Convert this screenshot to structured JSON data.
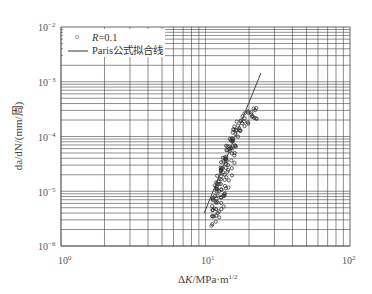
{
  "chart_data": {
    "type": "scatter",
    "title": "",
    "xlabel": "ΔK/MPa·m^1/2",
    "ylabel": "da/dN/(mm/周)",
    "xscale": "log",
    "yscale": "log",
    "xlim": [
      1,
      100
    ],
    "ylim": [
      1e-06,
      0.01
    ],
    "grid": true,
    "legend_position": "upper left",
    "x_ticks": [
      "10^0",
      "10^1",
      "10^2"
    ],
    "y_ticks": [
      "10^-6",
      "10^-5",
      "10^-4",
      "10^-3",
      "10^-2"
    ],
    "legend": [
      {
        "marker": "circle",
        "label_italic": "R",
        "label": "=0.1"
      },
      {
        "marker": "line",
        "label": "Paris公式拟合线"
      }
    ],
    "series": [
      {
        "name": "R=0.1",
        "type": "scatter",
        "points": [
          [
            11.1,
            2.8e-06
          ],
          [
            11.3,
            4.5e-06
          ],
          [
            11.5,
            6e-06
          ],
          [
            11.6,
            8e-06
          ],
          [
            11.8,
            1.1e-05
          ],
          [
            12.0,
            9e-06
          ],
          [
            12.2,
            1.4e-05
          ],
          [
            12.4,
            1.8e-05
          ],
          [
            12.6,
            1.2e-05
          ],
          [
            12.8,
            2.2e-05
          ],
          [
            13.0,
            2.8e-05
          ],
          [
            13.2,
            2e-05
          ],
          [
            13.5,
            3.5e-05
          ],
          [
            13.8,
            4.5e-05
          ],
          [
            14.0,
            3e-05
          ],
          [
            14.3,
            5.5e-05
          ],
          [
            14.6,
            6.8e-05
          ],
          [
            15.0,
            8e-05
          ],
          [
            15.4,
            9.5e-05
          ],
          [
            15.8,
            0.00011
          ],
          [
            16.3,
            0.00013
          ],
          [
            16.8,
            0.00015
          ],
          [
            17.5,
            0.00017
          ],
          [
            18.3,
            0.00019
          ],
          [
            19.2,
            0.00022
          ],
          [
            20.2,
            0.00024
          ],
          [
            21.3,
            0.00026
          ],
          [
            22.3,
            0.00028
          ],
          [
            12.1,
            3.5e-06
          ],
          [
            12.5,
            5e-06
          ],
          [
            13.1,
            7e-06
          ],
          [
            13.6,
            1e-05
          ],
          [
            14.2,
            1.5e-05
          ],
          [
            14.8,
            2.5e-05
          ],
          [
            15.5,
            4e-05
          ],
          [
            16.0,
            6e-05
          ]
        ]
      },
      {
        "name": "Paris公式拟合线",
        "type": "line",
        "points": [
          [
            9.8,
            4e-06
          ],
          [
            24.2,
            0.00145
          ]
        ]
      }
    ]
  }
}
